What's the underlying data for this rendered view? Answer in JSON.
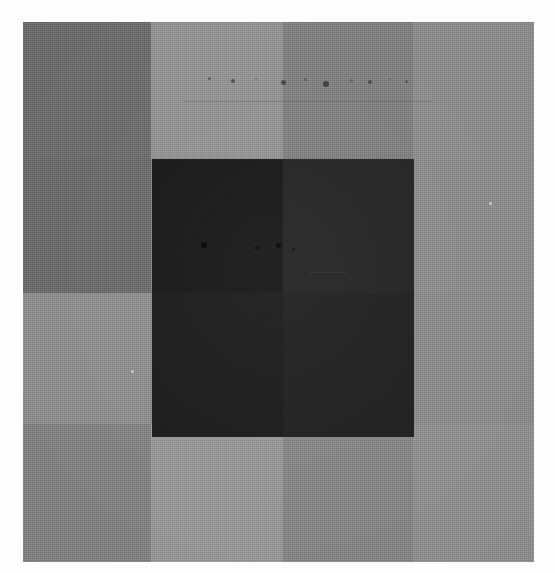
{
  "image": {
    "kind": "scanned-grayscale-grid-plate",
    "width": 555,
    "height": 573,
    "background_color": "#fdfdfd",
    "plate": {
      "left": 23,
      "top": 22,
      "width": 511,
      "height": 540,
      "base_color": "#808080"
    },
    "grid": {
      "column_edges": [
        23,
        151,
        283,
        413,
        534
      ],
      "row_edges": [
        22,
        159,
        293,
        424,
        562
      ],
      "columns": 4,
      "rows": 4
    },
    "patches": [
      {
        "name": "patch-r1c1",
        "left": 0,
        "top": 0,
        "width": 128,
        "height": 137,
        "color": "#6c6c6c"
      },
      {
        "name": "patch-r1c2",
        "left": 128,
        "top": 0,
        "width": 132,
        "height": 137,
        "color": "#919191"
      },
      {
        "name": "patch-r1c3",
        "left": 260,
        "top": 0,
        "width": 130,
        "height": 137,
        "color": "#7e7e7e"
      },
      {
        "name": "patch-r1c4",
        "left": 390,
        "top": 0,
        "width": 121,
        "height": 137,
        "color": "#8b8b8b"
      },
      {
        "name": "patch-r2c1",
        "left": 0,
        "top": 137,
        "width": 128,
        "height": 134,
        "color": "#6a6a6a"
      },
      {
        "name": "patch-r2c2",
        "left": 128,
        "top": 137,
        "width": 132,
        "height": 134,
        "color": "#7d7d7d"
      },
      {
        "name": "patch-r2c3",
        "left": 260,
        "top": 137,
        "width": 130,
        "height": 134,
        "color": "#767676"
      },
      {
        "name": "patch-r2c4",
        "left": 390,
        "top": 137,
        "width": 121,
        "height": 134,
        "color": "#8a8a8a"
      },
      {
        "name": "patch-r3c1",
        "left": 0,
        "top": 271,
        "width": 128,
        "height": 131,
        "color": "#8c8c8c"
      },
      {
        "name": "patch-r3c2",
        "left": 128,
        "top": 271,
        "width": 132,
        "height": 131,
        "color": "#858585"
      },
      {
        "name": "patch-r3c3",
        "left": 260,
        "top": 271,
        "width": 130,
        "height": 131,
        "color": "#7b7b7b"
      },
      {
        "name": "patch-r3c4",
        "left": 390,
        "top": 271,
        "width": 121,
        "height": 131,
        "color": "#898989"
      },
      {
        "name": "patch-r4c1",
        "left": 0,
        "top": 402,
        "width": 128,
        "height": 138,
        "color": "#818181"
      },
      {
        "name": "patch-r4c2",
        "left": 128,
        "top": 402,
        "width": 132,
        "height": 138,
        "color": "#959595"
      },
      {
        "name": "patch-r4c3",
        "left": 260,
        "top": 402,
        "width": 130,
        "height": 138,
        "color": "#848484"
      },
      {
        "name": "patch-r4c4",
        "left": 390,
        "top": 402,
        "width": 121,
        "height": 138,
        "color": "#8d8d8d"
      }
    ],
    "dark_block": {
      "label": "central-dark-block",
      "left": 129,
      "top": 137,
      "width": 262,
      "height": 278,
      "quadrants": [
        {
          "name": "dark-block-upper-left",
          "left": 0,
          "top": 0,
          "width": 131,
          "height": 134,
          "color": "#171717"
        },
        {
          "name": "dark-block-upper-right",
          "left": 131,
          "top": 0,
          "width": 131,
          "height": 134,
          "color": "#232323"
        },
        {
          "name": "dark-block-lower-left",
          "left": 0,
          "top": 134,
          "width": 131,
          "height": 144,
          "color": "#1b1b1b"
        },
        {
          "name": "dark-block-lower-right",
          "left": 131,
          "top": 134,
          "width": 131,
          "height": 144,
          "color": "#1f1f1f"
        }
      ]
    },
    "artifacts": {
      "description": "faint dust, speckle and scratch marks left by the scan",
      "specks": [
        {
          "name": "speck-upper-band-1",
          "left": 185,
          "top": 55,
          "size": 3,
          "color": "#4a4a4a",
          "opacity": 0.7
        },
        {
          "name": "speck-upper-band-2",
          "left": 208,
          "top": 57,
          "size": 4,
          "color": "#3c3c3c",
          "opacity": 0.75
        },
        {
          "name": "speck-upper-band-3",
          "left": 232,
          "top": 56,
          "size": 2,
          "color": "#555555",
          "opacity": 0.6
        },
        {
          "name": "speck-upper-band-4",
          "left": 258,
          "top": 58,
          "size": 5,
          "color": "#343434",
          "opacity": 0.78
        },
        {
          "name": "speck-upper-band-5",
          "left": 281,
          "top": 56,
          "size": 3,
          "color": "#474747",
          "opacity": 0.66
        },
        {
          "name": "speck-upper-band-6",
          "left": 300,
          "top": 59,
          "size": 6,
          "color": "#2e2e2e",
          "opacity": 0.8
        },
        {
          "name": "speck-upper-band-7",
          "left": 327,
          "top": 57,
          "size": 3,
          "color": "#4d4d4d",
          "opacity": 0.62
        },
        {
          "name": "speck-upper-band-8",
          "left": 345,
          "top": 58,
          "size": 4,
          "color": "#3a3a3a",
          "opacity": 0.7
        },
        {
          "name": "speck-upper-band-9",
          "left": 366,
          "top": 56,
          "size": 2,
          "color": "#515151",
          "opacity": 0.58
        },
        {
          "name": "speck-upper-band-10",
          "left": 382,
          "top": 58,
          "size": 3,
          "color": "#444444",
          "opacity": 0.64
        },
        {
          "name": "speck-block-1",
          "left": 178,
          "top": 220,
          "size": 6,
          "color": "#000000",
          "opacity": 0.85
        },
        {
          "name": "speck-block-2",
          "left": 232,
          "top": 224,
          "size": 4,
          "color": "#050505",
          "opacity": 0.8
        },
        {
          "name": "speck-block-3",
          "left": 253,
          "top": 221,
          "size": 5,
          "color": "#000000",
          "opacity": 0.82
        },
        {
          "name": "speck-block-4",
          "left": 269,
          "top": 226,
          "size": 3,
          "color": "#080808",
          "opacity": 0.7
        },
        {
          "name": "speck-right-field-1",
          "left": 466,
          "top": 180,
          "size": 3,
          "color": "#d8d8d8",
          "opacity": 0.8
        },
        {
          "name": "speck-left-field-1",
          "left": 108,
          "top": 348,
          "size": 3,
          "color": "#dcdcdc",
          "opacity": 0.78
        }
      ],
      "scratches": [
        {
          "name": "scratch-upper-horizontal",
          "left": 160,
          "top": 79,
          "width": 250,
          "height": 1,
          "color": "#5a5a5a",
          "opacity": 0.4
        },
        {
          "name": "scratch-block-horizontal",
          "left": 285,
          "top": 250,
          "width": 40,
          "height": 1,
          "color": "#3a3a3a",
          "opacity": 0.55
        }
      ]
    }
  }
}
